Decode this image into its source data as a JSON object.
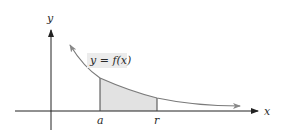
{
  "figure": {
    "type": "area-under-curve",
    "axes": {
      "x_label": "x",
      "y_label": "y"
    },
    "curve": {
      "label": "y = f(x)",
      "description": "decreasing curve approaching x-axis asymptotically"
    },
    "interval": {
      "start_label": "a",
      "end_label": "r",
      "shading": "region under curve between a and r"
    },
    "colors": {
      "axis": "#222222",
      "curve": "#7a7a7a",
      "shade": "#e2e2e2",
      "label_bg": "#ececec"
    }
  }
}
